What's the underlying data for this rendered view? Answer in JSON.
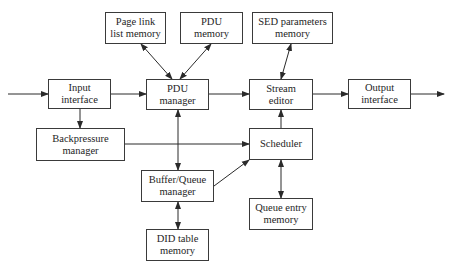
{
  "diagram": {
    "type": "block-diagram",
    "colors": {
      "line": "#2a2a2a",
      "box_border": "#3a3a3a",
      "text": "#1e1e1e",
      "background": "#ffffff"
    },
    "nodes": [
      {
        "id": "page_link",
        "line1": "Page link",
        "line2": "list memory"
      },
      {
        "id": "pdu_memory",
        "line1": "PDU",
        "line2": "memory"
      },
      {
        "id": "sed_params",
        "line1": "SED parameters",
        "line2": "memory"
      },
      {
        "id": "input_interface",
        "line1": "Input",
        "line2": "interface"
      },
      {
        "id": "pdu_manager",
        "line1": "PDU",
        "line2": "manager"
      },
      {
        "id": "stream_editor",
        "line1": "Stream",
        "line2": "editor"
      },
      {
        "id": "output_interface",
        "line1": "Output",
        "line2": "interface"
      },
      {
        "id": "backpressure",
        "line1": "Backpressure",
        "line2": "manager"
      },
      {
        "id": "scheduler",
        "line1": "Scheduler",
        "line2": ""
      },
      {
        "id": "buffer_queue",
        "line1": "Buffer/Queue",
        "line2": "manager"
      },
      {
        "id": "queue_entry",
        "line1": "Queue entry",
        "line2": "memory"
      },
      {
        "id": "did_table",
        "line1": "DID table",
        "line2": "memory"
      }
    ],
    "edges": [
      {
        "from": "external",
        "to": "input_interface",
        "dir": "forward"
      },
      {
        "from": "input_interface",
        "to": "pdu_manager",
        "dir": "forward"
      },
      {
        "from": "input_interface",
        "to": "backpressure",
        "dir": "forward"
      },
      {
        "from": "page_link",
        "to": "pdu_manager",
        "dir": "both"
      },
      {
        "from": "pdu_memory",
        "to": "pdu_manager",
        "dir": "both"
      },
      {
        "from": "pdu_manager",
        "to": "stream_editor",
        "dir": "forward"
      },
      {
        "from": "pdu_manager",
        "to": "buffer_queue",
        "dir": "both"
      },
      {
        "from": "sed_params",
        "to": "stream_editor",
        "dir": "both"
      },
      {
        "from": "stream_editor",
        "to": "output_interface",
        "dir": "forward"
      },
      {
        "from": "output_interface",
        "to": "external",
        "dir": "forward"
      },
      {
        "from": "backpressure",
        "to": "scheduler",
        "dir": "forward"
      },
      {
        "from": "buffer_queue",
        "to": "scheduler",
        "dir": "forward"
      },
      {
        "from": "scheduler",
        "to": "stream_editor",
        "dir": "forward"
      },
      {
        "from": "scheduler",
        "to": "queue_entry",
        "dir": "both"
      },
      {
        "from": "buffer_queue",
        "to": "did_table",
        "dir": "both"
      }
    ]
  }
}
